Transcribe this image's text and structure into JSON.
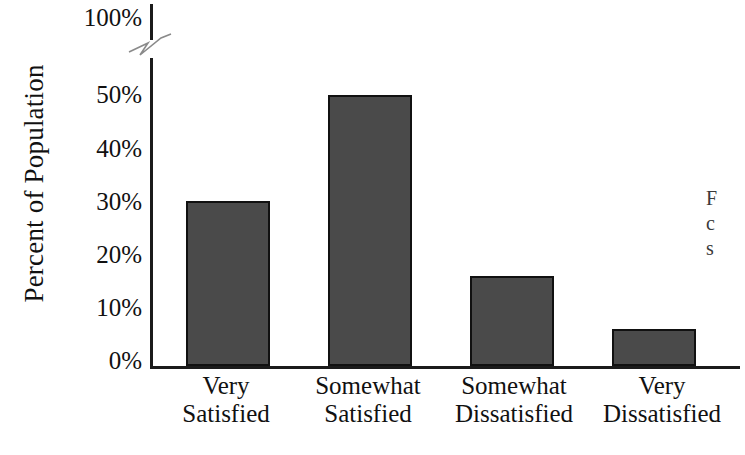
{
  "chart_data": {
    "type": "bar",
    "title": "",
    "subtitle": "",
    "xlabel": "",
    "ylabel": "Percent of Population",
    "categories": [
      "Very Satisfied",
      "Somewhat Satisfied",
      "Somewhat Dissatisfied",
      "Very Dissatisfied"
    ],
    "values": [
      31,
      51,
      17,
      7
    ],
    "ylim": [
      0,
      100
    ],
    "y_tick_labels": [
      "0%",
      "10%",
      "20%",
      "30%",
      "40%",
      "50%",
      "100%"
    ],
    "y_ticks": [
      0,
      10,
      20,
      30,
      40,
      50,
      100
    ],
    "axis_break": true,
    "axis_break_between": [
      50,
      100
    ],
    "grid": false,
    "legend": false,
    "bar_color": "#4a4a4a",
    "bar_border_color": "#111111",
    "axis_color": "#1b1b1b",
    "background_color": "#ffffff"
  },
  "axes": {
    "y_title": "Percent of Population",
    "y_ticks": [
      {
        "label": "100%",
        "value": 100
      },
      {
        "label": "50%",
        "value": 50
      },
      {
        "label": "40%",
        "value": 40
      },
      {
        "label": "30%",
        "value": 30
      },
      {
        "label": "20%",
        "value": 20
      },
      {
        "label": "10%",
        "value": 10
      },
      {
        "label": "0%",
        "value": 0
      }
    ]
  },
  "bars": [
    {
      "label_line1": "Very",
      "label_line2": "Satisfied",
      "value": 31
    },
    {
      "label_line1": "Somewhat",
      "label_line2": "Satisfied",
      "value": 51
    },
    {
      "label_line1": "Somewhat",
      "label_line2": "Dissatisfied",
      "value": 17
    },
    {
      "label_line1": "Very",
      "label_line2": "Dissatisfied",
      "value": 7
    }
  ],
  "side_caption": {
    "line1": "F",
    "line2": "c",
    "line3": "s"
  }
}
